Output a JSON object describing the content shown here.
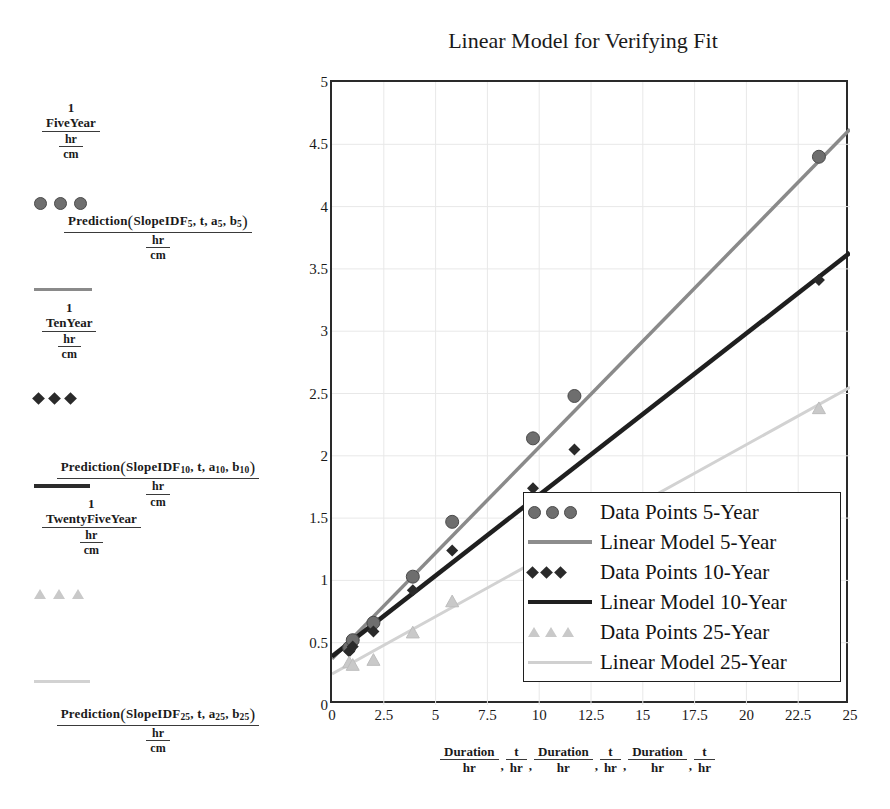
{
  "chart_data": {
    "type": "scatter",
    "title": "Linear Model for Verifying Fit",
    "xlabel": "Duration/hr , t/hr , Duration/hr , t/hr , Duration/hr , t/hr",
    "ylabel": "",
    "xlim": [
      0,
      25
    ],
    "ylim": [
      0,
      5
    ],
    "xticks": [
      "0",
      "2.5",
      "5",
      "7.5",
      "10",
      "12.5",
      "15",
      "17.5",
      "20",
      "22.5",
      "25"
    ],
    "xtick_values": [
      0,
      2.5,
      5,
      7.5,
      10,
      12.5,
      15,
      17.5,
      20,
      22.5,
      25
    ],
    "yticks": [
      "0",
      "0.5",
      "1",
      "1.5",
      "2",
      "2.5",
      "3",
      "3.5",
      "4",
      "4.5",
      "5"
    ],
    "ytick_values": [
      0,
      0.5,
      1,
      1.5,
      2,
      2.5,
      3,
      3.5,
      4,
      4.5,
      5
    ],
    "grid": true,
    "legend_position": "inside-bottom-right",
    "series": [
      {
        "name": "Data Points 5-Year",
        "marker": "circle",
        "color": "#6e6e6e",
        "x": [
          0.83,
          1.0,
          2.0,
          3.9,
          5.8,
          9.7,
          11.7,
          23.5
        ],
        "y": [
          0.46,
          0.52,
          0.66,
          1.03,
          1.47,
          2.14,
          2.48,
          4.4
        ]
      },
      {
        "name": "Linear Model 5-Year",
        "marker": "line",
        "color": "#8a8a8a",
        "x": [
          0,
          25
        ],
        "y": [
          0.37,
          4.62
        ]
      },
      {
        "name": "Data Points 10-Year",
        "marker": "diamond",
        "color": "#2a2a2a",
        "x": [
          0.83,
          1.0,
          2.0,
          3.9,
          5.8,
          9.7,
          11.7,
          23.5
        ],
        "y": [
          0.43,
          0.47,
          0.59,
          0.92,
          1.24,
          1.74,
          2.05,
          3.41
        ]
      },
      {
        "name": "Linear Model 10-Year",
        "marker": "line",
        "color": "#1f1f1f",
        "x": [
          0,
          25
        ],
        "y": [
          0.39,
          3.63
        ]
      },
      {
        "name": "Data Points 25-Year",
        "marker": "triangle",
        "color": "#c9c9c9",
        "x": [
          0.83,
          1.0,
          2.0,
          3.9,
          5.8,
          9.7,
          11.7,
          23.5
        ],
        "y": [
          0.34,
          0.32,
          0.36,
          0.58,
          0.83,
          1.25,
          1.48,
          2.38
        ]
      },
      {
        "name": "Linear Model 25-Year",
        "marker": "line",
        "color": "#d2d2d2",
        "x": [
          0,
          25
        ],
        "y": [
          0.25,
          2.55
        ]
      }
    ]
  },
  "title": "Linear Model for Verifying Fit",
  "plot_legend": {
    "items": [
      {
        "label": "Data Points 5-Year",
        "key": "markers-circle"
      },
      {
        "label": "Linear Model 5-Year",
        "key": "line-5"
      },
      {
        "label": "Data Points 10-Year",
        "key": "markers-diamond"
      },
      {
        "label": "Linear Model 10-Year",
        "key": "line-10"
      },
      {
        "label": "Data Points 25-Year",
        "key": "markers-triangle"
      },
      {
        "label": "Linear Model 25-Year",
        "key": "line-25"
      }
    ]
  },
  "left_legend": {
    "five_year": {
      "numerator_top": "1",
      "numerator_mid": "FiveYear",
      "denominator_1": "hr",
      "denominator_2": "cm",
      "prediction_expr_prefix": "Prediction",
      "prediction_expr_args": "SlopeIDF5, t, a5, b5",
      "prediction_base": "SlopeIDF",
      "prediction_sub": "5",
      "prediction_t": "t",
      "prediction_a": "a",
      "prediction_b": "b",
      "pred_den_1": "hr",
      "pred_den_2": "cm"
    },
    "ten_year": {
      "numerator_top": "1",
      "numerator_mid": "TenYear",
      "denominator_1": "hr",
      "denominator_2": "cm",
      "prediction_expr_prefix": "Prediction",
      "prediction_base": "SlopeIDF",
      "prediction_sub": "10",
      "prediction_t": "t",
      "prediction_a": "a",
      "prediction_b": "b",
      "pred_den_1": "hr",
      "pred_den_2": "cm"
    },
    "twentyfive_year": {
      "numerator_top": "1",
      "numerator_mid": "TwentyFiveYear",
      "denominator_1": "hr",
      "denominator_2": "cm",
      "prediction_expr_prefix": "Prediction",
      "prediction_base": "SlopeIDF",
      "prediction_sub": "25",
      "prediction_t": "t",
      "prediction_a": "a",
      "prediction_b": "b",
      "pred_den_1": "hr",
      "pred_den_2": "cm"
    }
  },
  "x_caption": {
    "groups": [
      {
        "num": "Duration",
        "den": "hr"
      },
      {
        "num": "t",
        "den": "hr"
      },
      {
        "num": "Duration",
        "den": "hr"
      },
      {
        "num": "t",
        "den": "hr"
      },
      {
        "num": "Duration",
        "den": "hr"
      },
      {
        "num": "t",
        "den": "hr"
      }
    ],
    "separator": ","
  },
  "colors": {
    "five_year": "#6e6e6e",
    "five_year_line": "#8a8a8a",
    "ten_year": "#2a2a2a",
    "ten_year_line": "#1f1f1f",
    "twentyfive_year": "#c9c9c9",
    "twentyfive_year_line": "#d2d2d2",
    "axis": "#2a2a2a",
    "grid": "#e8e8e8"
  }
}
